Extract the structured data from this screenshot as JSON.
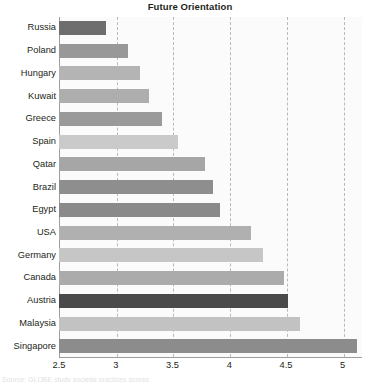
{
  "chart_data": {
    "type": "bar",
    "orientation": "horizontal",
    "title": "Future Orientation",
    "xlabel": "",
    "ylabel": "",
    "xlim": [
      2.5,
      5.17
    ],
    "xticks": [
      "2.5",
      "3",
      "3.5",
      "4",
      "4.5",
      "5"
    ],
    "xtick_values": [
      2.5,
      3,
      3.5,
      4,
      4.5,
      5
    ],
    "grid": "vertical-dashed",
    "legend": "none",
    "categories": [
      "Russia",
      "Poland",
      "Hungary",
      "Kuwait",
      "Greece",
      "Spain",
      "Qatar",
      "Brazil",
      "Egypt",
      "USA",
      "Germany",
      "Canada",
      "Austria",
      "Malaysia",
      "Singapore"
    ],
    "values": [
      2.91,
      3.11,
      3.21,
      3.29,
      3.41,
      3.55,
      3.79,
      3.86,
      3.92,
      4.19,
      4.3,
      4.48,
      4.52,
      4.62,
      5.13
    ],
    "bar_colors": [
      "#6e6e6e",
      "#989898",
      "#b4b4b4",
      "#aeaeae",
      "#9a9a9a",
      "#cacaca",
      "#a6a6a6",
      "#8e8e8e",
      "#8a8a8a",
      "#b0b0b0",
      "#c6c6c6",
      "#ababab",
      "#4a4a4a",
      "#c2c2c2",
      "#8c8c8c"
    ]
  },
  "axis": {
    "tick_color": "#231f20",
    "line_color": "#9d9d9d",
    "grid_color": "#b9b9b9"
  },
  "caption": {
    "clipped_text": "Source: GLOBE study societal practices scores"
  }
}
